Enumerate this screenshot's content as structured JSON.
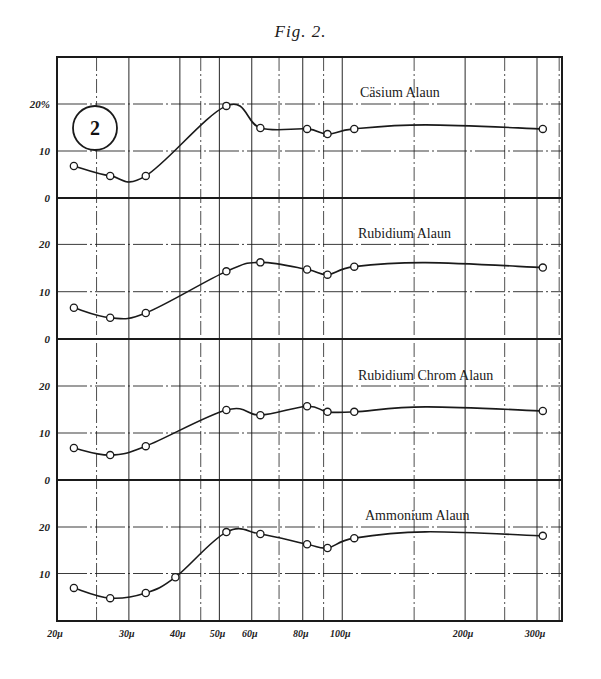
{
  "figure": {
    "title": "Fig. 2.",
    "panel_number": "2",
    "ink_color": "#1a1a1a",
    "background": "#ffffff"
  },
  "chart_data": {
    "type": "line",
    "title": "Fig. 2.",
    "xlabel": "",
    "ylabel": "",
    "xscale": "log",
    "xlim": [
      19.5,
      340
    ],
    "x_tick_labels": [
      "20μ",
      "30μ",
      "40μ",
      "50μ",
      "60μ",
      "80μ",
      "100μ",
      "200μ",
      "300μ"
    ],
    "x_ticks": [
      20,
      30,
      40,
      50,
      60,
      80,
      100,
      200,
      300
    ],
    "x_gridlines": [
      20,
      25,
      30,
      40,
      45,
      50,
      60,
      70,
      80,
      90,
      100,
      150,
      200,
      250,
      300,
      340
    ],
    "y_tick_labels_top_panel": [
      "0",
      "10",
      "20%"
    ],
    "y_tick_labels": [
      "0",
      "10",
      "20"
    ],
    "ylim": [
      0,
      30
    ],
    "grid": true,
    "legend_position": "inline label per panel (upper right)",
    "panels": [
      {
        "name": "Cäsium Alaun",
        "x": [
          22,
          27,
          33,
          52,
          63,
          82,
          92,
          107,
          310
        ],
        "values": [
          6.8,
          4.7,
          4.7,
          19.6,
          14.9,
          14.7,
          13.6,
          14.7,
          14.7
        ]
      },
      {
        "name": "Rubidium Alaun",
        "x": [
          22,
          27,
          33,
          52,
          63,
          82,
          92,
          107,
          310
        ],
        "values": [
          6.6,
          4.5,
          5.5,
          14.3,
          16.2,
          14.7,
          13.6,
          15.3,
          15.1
        ]
      },
      {
        "name": "Rubidium Chrom Alaun",
        "x": [
          22,
          27,
          33,
          52,
          63,
          82,
          92,
          107,
          310
        ],
        "values": [
          6.8,
          5.3,
          7.2,
          14.9,
          13.8,
          15.7,
          14.5,
          14.5,
          14.7
        ]
      },
      {
        "name": "Ammonium Alaun",
        "x": [
          22,
          27,
          33,
          39,
          52,
          63,
          82,
          92,
          107,
          310
        ],
        "values": [
          6.9,
          4.7,
          5.8,
          9.2,
          18.9,
          18.5,
          16.3,
          15.5,
          17.6,
          18.1
        ]
      }
    ]
  }
}
